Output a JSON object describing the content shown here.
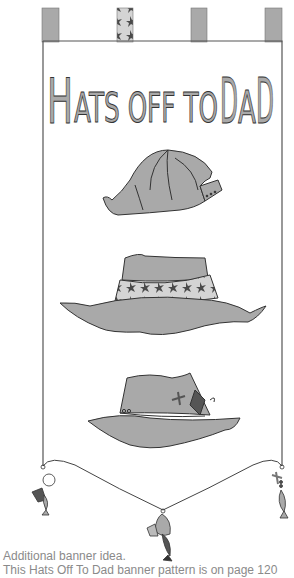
{
  "banner": {
    "title": {
      "first_letter": "H",
      "words": "ATS OFF TO ",
      "d1": "D",
      "a": "A",
      "d2": "D",
      "full": "Hats Off To Dad"
    },
    "hats": [
      {
        "name": "baseball-cap"
      },
      {
        "name": "floral-bucket-hat"
      },
      {
        "name": "fishing-hat"
      }
    ],
    "charms": [
      "left-fish-charm",
      "center-fish-charm",
      "right-fish-charm"
    ],
    "colors": {
      "fill": "#a9a9a9",
      "dark": "#555555",
      "light": "#d4d4d4",
      "stroke": "#333333",
      "border": "#555555"
    }
  },
  "captions": {
    "line1": "Additional banner idea.",
    "line2": "This Hats Off To Dad banner pattern is on page 120"
  }
}
